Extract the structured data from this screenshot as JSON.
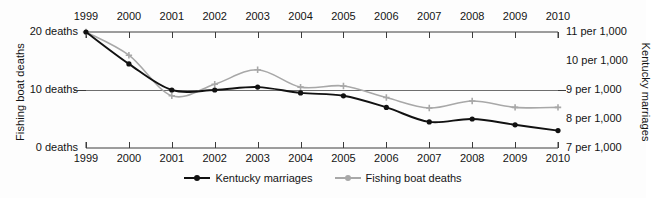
{
  "chart_data": {
    "type": "line",
    "title": "",
    "subtitle": "",
    "xlabel": "",
    "grid": false,
    "legend_position": "bottom-center",
    "x": [
      1999,
      2000,
      2001,
      2002,
      2003,
      2004,
      2005,
      2006,
      2007,
      2008,
      2009,
      2010
    ],
    "x_tick_labels_top": [
      "1999",
      "2000",
      "2001",
      "2002",
      "2003",
      "2004",
      "2005",
      "2006",
      "2007",
      "2008",
      "2009",
      "2010"
    ],
    "x_tick_labels_bottom": [
      "1999",
      "2000",
      "2001",
      "2002",
      "2003",
      "2004",
      "2005",
      "2006",
      "2007",
      "2008",
      "2009",
      "2010"
    ],
    "axes": [
      {
        "id": "left",
        "label": "Fishing boat deaths",
        "tick_labels": [
          "20 deaths",
          "10 deaths",
          "0 deaths"
        ],
        "tick_values": [
          20,
          10,
          0
        ],
        "lim": [
          0,
          20
        ],
        "unit": "deaths"
      },
      {
        "id": "right",
        "label": "Kentucky marriages",
        "tick_labels": [
          "11 per 1,000",
          "10 per 1,000",
          "9 per 1,000",
          "8 per 1,000",
          "7 per 1,000"
        ],
        "tick_values": [
          11,
          10,
          9,
          8,
          7
        ],
        "lim": [
          7,
          11
        ],
        "unit": "per 1,000"
      }
    ],
    "series": [
      {
        "name": "Kentucky marriages",
        "axis": "right",
        "color": "#111111",
        "marker": "circle",
        "values": [
          11.0,
          9.9,
          9.0,
          9.0,
          9.1,
          8.9,
          8.8,
          8.4,
          7.9,
          8.0,
          7.8,
          7.6
        ]
      },
      {
        "name": "Fishing boat deaths",
        "axis": "left",
        "color": "#a8a8a8",
        "marker": "plus",
        "values": [
          20,
          16,
          9,
          11,
          13.5,
          10.5,
          10.7,
          8.7,
          6.9,
          8.1,
          7.0,
          7.0
        ]
      }
    ],
    "legend": [
      {
        "label": "Kentucky marriages",
        "color": "#111111"
      },
      {
        "label": "Fishing boat deaths",
        "color": "#a8a8a8"
      }
    ]
  },
  "colors": {
    "series_black": "#111111",
    "series_gray": "#a8a8a8",
    "axis": "#3c3c3c",
    "background": "#fdfdfd",
    "text": "#141414"
  }
}
